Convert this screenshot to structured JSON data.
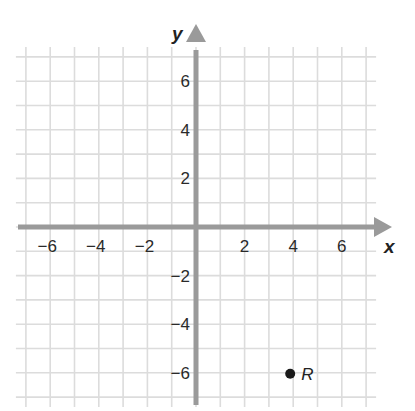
{
  "chart_data": {
    "type": "scatter",
    "title": "",
    "xlabel": "x",
    "ylabel": "y",
    "xlim": [
      -7,
      7
    ],
    "ylim": [
      -7,
      7
    ],
    "grid": true,
    "grid_step": 1,
    "x_ticks": [
      -6,
      -4,
      -2,
      2,
      4,
      6
    ],
    "y_ticks": [
      6,
      4,
      2,
      -2,
      -4,
      -6
    ],
    "x_tick_labels": [
      "−6",
      "−4",
      "−2",
      "2",
      "4",
      "6"
    ],
    "y_tick_labels": [
      "6",
      "4",
      "2",
      "−2",
      "−4",
      "−6"
    ],
    "points": [
      {
        "label": "R",
        "x": 4,
        "y": -6
      }
    ],
    "legend": null
  },
  "colors": {
    "grid": "#dcdcdc",
    "axis": "#9a9a9a",
    "point": "#1a1a1a",
    "text": "#2a2a2a"
  }
}
